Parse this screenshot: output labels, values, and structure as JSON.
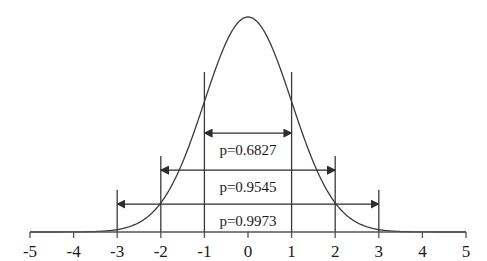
{
  "figure": {
    "title": "",
    "width": 487,
    "height": 261,
    "background": "#ffffff",
    "line_color": "#3a3a3a",
    "text_color": "#1a1a1a"
  },
  "chart_data": {
    "type": "line",
    "title": "",
    "xlabel": "",
    "ylabel": "",
    "xlim": [
      -5,
      5
    ],
    "ylim": [
      0,
      1
    ],
    "grid": false,
    "legend": "none",
    "curve": {
      "name": "standard-normal-pdf",
      "description": "Standard normal probability density curve, mean 0, standard deviation 1",
      "mean": 0,
      "sd": 1,
      "peak_x": 0,
      "peak_y": 1
    },
    "xticks": [
      -5,
      -4,
      -3,
      -2,
      -1,
      0,
      1,
      2,
      3,
      4,
      5
    ],
    "xticklabels": [
      "-5",
      "-4",
      "-3",
      "-2",
      "-1",
      "0",
      "1",
      "2",
      "3",
      "4",
      "5"
    ],
    "yticks": [],
    "yticklabels": [],
    "vertical_lines": [
      {
        "x": -3,
        "top_frac": 0.196
      },
      {
        "x": -2,
        "top_frac": 0.354
      },
      {
        "x": -1,
        "top_frac": 0.744
      },
      {
        "x": 1,
        "top_frac": 0.744
      },
      {
        "x": 2,
        "top_frac": 0.354
      },
      {
        "x": 3,
        "top_frac": 0.196
      }
    ],
    "annotations": [
      {
        "label": "p=0.6827",
        "value": 0.6827,
        "x_from": -1,
        "x_to": 1,
        "sigma": 1,
        "y_frac": 0.46,
        "arrow": "double"
      },
      {
        "label": "p=0.9545",
        "value": 0.9545,
        "x_from": -2,
        "x_to": 2,
        "sigma": 2,
        "y_frac": 0.288,
        "arrow": "double"
      },
      {
        "label": "p=0.9973",
        "value": 0.9973,
        "x_from": -3,
        "x_to": 3,
        "sigma": 3,
        "y_frac": 0.13,
        "arrow": "double"
      }
    ]
  }
}
